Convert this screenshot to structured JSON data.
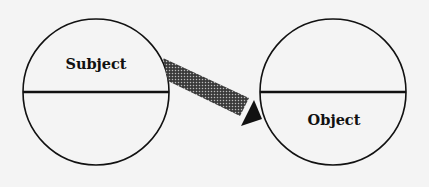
{
  "diagram": {
    "type": "subject-object relation",
    "background": "#f4f4f4",
    "nodes": [
      {
        "id": "subject",
        "label": "Subject",
        "shape": "circle divided by horizontal line",
        "label_position": "upper half"
      },
      {
        "id": "object",
        "label": "Object",
        "shape": "circle divided by horizontal line",
        "label_position": "lower half"
      }
    ],
    "edges": [
      {
        "from": "subject",
        "to": "object",
        "style": "thick halftone-shaded arrow with solid black head",
        "direction": "from upper half of Subject to lower half of Object"
      }
    ],
    "colors": {
      "stroke": "#111111",
      "arrow_shaft": "#555555",
      "arrow_head": "#111111"
    }
  }
}
